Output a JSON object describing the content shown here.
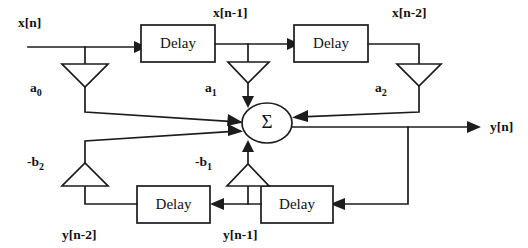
{
  "diagram": {
    "type": "signal-flow-diagram",
    "stroke_color": "#1c1c1c",
    "background_color": "#ffffff",
    "blocks": [
      {
        "id": "delay-x1",
        "label": "Delay"
      },
      {
        "id": "delay-x2",
        "label": "Delay"
      },
      {
        "id": "delay-y2",
        "label": "Delay"
      },
      {
        "id": "delay-y1",
        "label": "Delay"
      }
    ],
    "summation": {
      "id": "summing-node",
      "label": "Σ"
    },
    "signal_labels": {
      "input": "x[n]",
      "x_n_1": "x[n-1]",
      "x_n_2": "x[n-2]",
      "output": "y[n]",
      "y_n_1": "y[n-1]",
      "y_n_2": "y[n-2]"
    },
    "gains": [
      {
        "id": "gain-a0",
        "label": "a",
        "subscript": "0",
        "direction": "down"
      },
      {
        "id": "gain-a1",
        "label": "a",
        "subscript": "1",
        "direction": "down"
      },
      {
        "id": "gain-a2",
        "label": "a",
        "subscript": "2",
        "direction": "down"
      },
      {
        "id": "gain-b1",
        "label": "-b",
        "subscript": "1",
        "direction": "up"
      },
      {
        "id": "gain-b2",
        "label": "-b",
        "subscript": "2",
        "direction": "up"
      }
    ]
  }
}
